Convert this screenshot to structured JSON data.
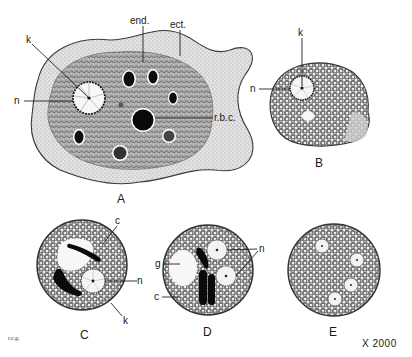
{
  "figure": {
    "magnification": "X 2000",
    "signature": "r.c.g.",
    "colors": {
      "ink": "#1a1a1a",
      "ectoplasm": "#d9d9d9",
      "endoplasm": "#bdbdbd",
      "cyst_wall": "#555555",
      "background": "#ffffff"
    },
    "panels": [
      {
        "id": "A",
        "caption": "A",
        "labels": {
          "k": "k",
          "n": "n",
          "end": "end.",
          "ect": "ect.",
          "rbc": "r.b.c."
        }
      },
      {
        "id": "B",
        "caption": "B",
        "labels": {
          "k": "k",
          "n": "n"
        }
      },
      {
        "id": "C",
        "caption": "C",
        "labels": {
          "c": "c",
          "n": "n",
          "k": "k"
        }
      },
      {
        "id": "D",
        "caption": "D",
        "labels": {
          "g": "g",
          "c": "c",
          "n": "n"
        }
      },
      {
        "id": "E",
        "caption": "E",
        "labels": {}
      }
    ]
  }
}
